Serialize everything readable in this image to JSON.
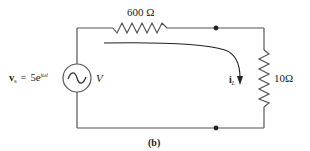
{
  "figure": {
    "caption": "(b)"
  },
  "source": {
    "symbol": "v",
    "subscript": "s",
    "equals": "=",
    "coefficient": "5e",
    "exponent": "jωt",
    "unit": "V"
  },
  "series_resistor": {
    "label": "600 Ω"
  },
  "load_resistor": {
    "label": "10Ω"
  },
  "current": {
    "symbol": "i",
    "subscript": "L"
  },
  "colors": {
    "wire": "#555555",
    "text": "#222222",
    "background": "#ffffff"
  }
}
